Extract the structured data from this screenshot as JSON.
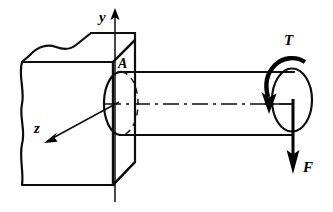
{
  "figure": {
    "background_color": "#ffffff",
    "line_color": "#0d0d0d",
    "width": 333,
    "height": 212
  },
  "labels": {
    "y_axis": "y",
    "z_axis": "z",
    "point_a": "A",
    "torque": "T",
    "force": "F"
  },
  "annotations": {
    "y_axis_name": "vertical-axis",
    "z_axis_name": "depth-axis",
    "point_a_name": "section-point-a",
    "torque_name": "applied-torque",
    "force_name": "applied-force"
  },
  "geometry": {
    "support_block": {
      "name": "fixed-wall-block",
      "front_face": "wavy-left-edge rectangle",
      "front_left_x": 22,
      "front_right_x": 113,
      "front_top_y": 62,
      "front_bottom_y": 185,
      "top_face_back_right_x": 135,
      "top_face_back_right_y": 40,
      "right_face_bottom_y": 162
    },
    "shaft": {
      "name": "circular-shaft",
      "top_y": 72,
      "bottom_y": 135,
      "left_x": 117,
      "right_x": 293,
      "left_cap_rx": 17,
      "left_cap_ry": 31.5,
      "right_cap_cx": 292,
      "right_cap_cy": 99,
      "right_cap_rx": 20,
      "right_cap_ry": 31
    },
    "centerline": {
      "name": "shaft-axis-centerline",
      "y": 104,
      "from_x": 105,
      "to_x": 293
    },
    "y_axis_line": {
      "x": 115,
      "from_y": 200,
      "to_y": 10
    },
    "z_axis_line": {
      "from_x": 117,
      "from_y": 104,
      "to_x": 45,
      "to_y": 142
    },
    "force_arrow": {
      "x": 293,
      "from_y": 104,
      "to_y": 172
    },
    "torque_arrow": {
      "direction": "counterclockwise-viewed-from-right-end"
    }
  }
}
